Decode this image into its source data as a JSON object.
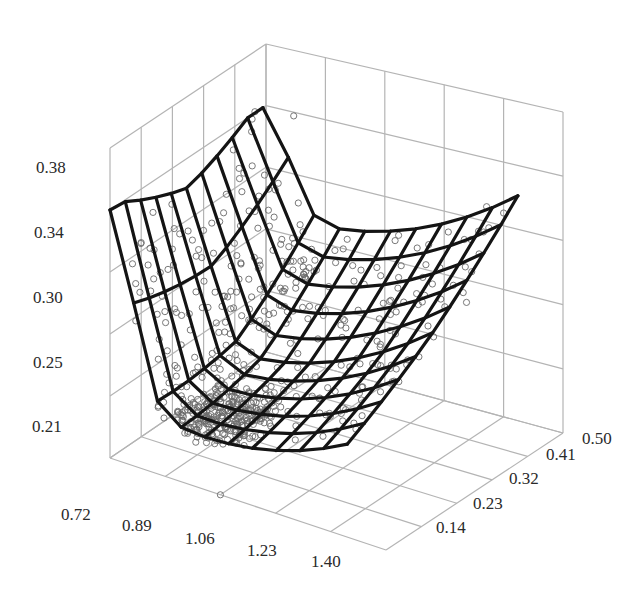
{
  "chart_data": {
    "type": "3d-surface-scatter",
    "title": "",
    "xlabel": "",
    "ylabel": "",
    "zlabel": "",
    "x_ticks": [
      "0.72",
      "0.89",
      "1.06",
      "1.23",
      "1.40"
    ],
    "y_ticks": [
      "0.14",
      "0.23",
      "0.32",
      "0.41",
      "0.50"
    ],
    "z_ticks": [
      "0.21",
      "0.25",
      "0.30",
      "0.34",
      "0.38"
    ],
    "xlim": [
      0.72,
      1.57
    ],
    "ylim": [
      0.05,
      0.5
    ],
    "zlim": [
      0.17,
      0.42
    ],
    "grid": true,
    "legend": "none",
    "surface": {
      "description": "Fitted bowl-shaped response surface (wireframe mesh), minimum near x≈0.95, y≈0.14, z≈0.21; highest at x=0.72,y=0.05 (≈0.36)",
      "x": [
        0.72,
        0.8,
        0.88,
        0.96,
        1.04,
        1.12,
        1.2,
        1.28,
        1.36,
        1.44
      ],
      "y": [
        0.05,
        0.1,
        0.15,
        0.2,
        0.25,
        0.3,
        0.35,
        0.4,
        0.45,
        0.5
      ],
      "z_min": 0.21,
      "z_max": 0.36
    },
    "scatter": {
      "description": "Observed data points (open circles), dense cluster near surface minimum, spread along surface; a few outliers",
      "approx_count": 600,
      "outliers": [
        {
          "x": 0.85,
          "y": 0.45,
          "z": 0.38
        },
        {
          "x": 1.4,
          "y": 0.5,
          "z": 0.33
        },
        {
          "x": 1.06,
          "y": 0.05,
          "z": 0.17
        }
      ]
    }
  },
  "labels": {
    "x": [
      "0.72",
      "0.89",
      "1.06",
      "1.23",
      "1.40"
    ],
    "y": [
      "0.14",
      "0.23",
      "0.32",
      "0.41",
      "0.50"
    ],
    "z": [
      "0.21",
      "0.25",
      "0.30",
      "0.34",
      "0.38"
    ]
  }
}
